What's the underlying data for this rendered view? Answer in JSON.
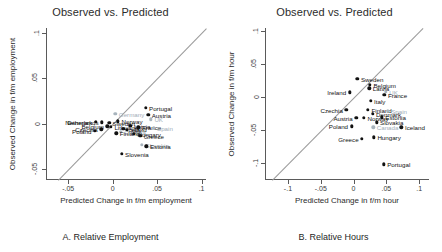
{
  "figure": {
    "panels": [
      {
        "id": "panel-a",
        "title": "Observed vs. Predicted",
        "caption": "A. Relative Employment",
        "xlabel": "Predicted Change in f/m employment",
        "ylabel": "Observed Change in f/m employment",
        "xticks": [
          "-.05",
          "0",
          ".05",
          ".1"
        ],
        "yticks": [
          "-.05",
          "0",
          ".05",
          ".1"
        ]
      },
      {
        "id": "panel-b",
        "title": "Observed vs. Predicted",
        "caption": "B. Relative Hours",
        "xlabel": "Predicted Change in f/m hour",
        "ylabel": "Observed Change in f/m hour",
        "xticks": [
          "-.1",
          "-.05",
          "0",
          ".05",
          ".1"
        ],
        "yticks": [
          "-.1",
          "-.05",
          "0",
          ".05",
          ".1"
        ]
      }
    ]
  },
  "chart_data": [
    {
      "type": "scatter",
      "panel": "A. Relative Employment",
      "title": "Observed vs. Predicted",
      "xlabel": "Predicted Change in f/m employment",
      "ylabel": "Observed Change in f/m employment",
      "xlim": [
        -0.075,
        0.105
      ],
      "ylim": [
        -0.062,
        0.105
      ],
      "xticks": [
        -0.05,
        0,
        0.05,
        0.1
      ],
      "yticks": [
        -0.05,
        0,
        0.05,
        0.1
      ],
      "grid": false,
      "legend": "none",
      "reference_line": {
        "type": "45-degree identity",
        "color": "#9a9a9a"
      },
      "points": [
        {
          "label": "Portugal",
          "x": 0.037,
          "y": 0.0175,
          "color": "dark"
        },
        {
          "label": "Austria",
          "x": 0.04,
          "y": 0.0095,
          "color": "dark"
        },
        {
          "label": "UK",
          "x": 0.043,
          "y": 0.0045,
          "color": "light"
        },
        {
          "label": "Germany",
          "x": 0.003,
          "y": 0.0105,
          "color": "light"
        },
        {
          "label": "Norway",
          "x": 0.006,
          "y": 0.0025,
          "color": "dark"
        },
        {
          "label": "Denmark",
          "x": -0.019,
          "y": 0.002,
          "color": "dark"
        },
        {
          "label": "Netherlands",
          "x": -0.012,
          "y": 0.0015,
          "color": "dark"
        },
        {
          "label": "Sweden",
          "x": -0.004,
          "y": 0.001,
          "color": "dark"
        },
        {
          "label": "Latvia",
          "x": 0.02,
          "y": -0.0025,
          "color": "dark"
        },
        {
          "label": "France",
          "x": 0.029,
          "y": -0.004,
          "color": "dark"
        },
        {
          "label": "Spain",
          "x": 0.046,
          "y": -0.0045,
          "color": "light"
        },
        {
          "label": "Belgium",
          "x": -0.006,
          "y": -0.003,
          "color": "dark"
        },
        {
          "label": "Lithuania",
          "x": -0.002,
          "y": -0.0035,
          "color": "dark"
        },
        {
          "label": "Czechia",
          "x": -0.013,
          "y": -0.0065,
          "color": "dark"
        },
        {
          "label": "Iceland",
          "x": 0.012,
          "y": -0.006,
          "color": "dark"
        },
        {
          "label": "Italy",
          "x": 0.016,
          "y": -0.007,
          "color": "dark"
        },
        {
          "label": "Canada",
          "x": 0.009,
          "y": -0.009,
          "color": "light"
        },
        {
          "label": "Poland",
          "x": -0.02,
          "y": -0.008,
          "color": "dark"
        },
        {
          "label": "Finland",
          "x": 0.004,
          "y": -0.0105,
          "color": "dark"
        },
        {
          "label": "Hungary",
          "x": 0.024,
          "y": -0.0115,
          "color": "dark"
        },
        {
          "label": "Greece",
          "x": 0.031,
          "y": -0.0135,
          "color": "dark"
        },
        {
          "label": "Slovakia",
          "x": 0.033,
          "y": -0.0235,
          "color": "light"
        },
        {
          "label": "Estonia",
          "x": 0.038,
          "y": -0.025,
          "color": "dark"
        },
        {
          "label": "Slovenia",
          "x": 0.01,
          "y": -0.033,
          "color": "dark"
        }
      ]
    },
    {
      "type": "scatter",
      "panel": "B. Relative Hours",
      "title": "Observed vs. Predicted",
      "xlabel": "Predicted Change in f/m hour",
      "ylabel": "Observed Change in f/m hour",
      "xlim": [
        -0.135,
        0.115
      ],
      "ylim": [
        -0.125,
        0.105
      ],
      "xticks": [
        -0.1,
        -0.05,
        0,
        0.05,
        0.1
      ],
      "yticks": [
        -0.1,
        -0.05,
        0,
        0.05,
        0.1
      ],
      "grid": false,
      "legend": "none",
      "reference_line": {
        "type": "45-degree identity",
        "color": "#9a9a9a"
      },
      "points": [
        {
          "label": "Sweden",
          "x": 0.006,
          "y": 0.0285,
          "color": "dark"
        },
        {
          "label": "Belgium",
          "x": 0.025,
          "y": 0.0195,
          "color": "dark"
        },
        {
          "label": "Latvia",
          "x": 0.024,
          "y": 0.014,
          "color": "dark"
        },
        {
          "label": "UK",
          "x": 0.049,
          "y": 0.0085,
          "color": "light"
        },
        {
          "label": "France",
          "x": 0.047,
          "y": 0.0035,
          "color": "dark"
        },
        {
          "label": "Ireland",
          "x": -0.006,
          "y": 0.0075,
          "color": "dark"
        },
        {
          "label": "Italy",
          "x": 0.026,
          "y": -0.0055,
          "color": "dark"
        },
        {
          "label": "Czechia",
          "x": -0.011,
          "y": -0.0185,
          "color": "dark"
        },
        {
          "label": "Finland",
          "x": 0.022,
          "y": -0.0185,
          "color": "dark"
        },
        {
          "label": "Spain",
          "x": 0.052,
          "y": -0.02,
          "color": "light"
        },
        {
          "label": "Denmark",
          "x": 0.029,
          "y": -0.0245,
          "color": "dark"
        },
        {
          "label": "Austria",
          "x": 0.004,
          "y": -0.0305,
          "color": "dark"
        },
        {
          "label": "Norway",
          "x": 0.016,
          "y": -0.031,
          "color": "dark"
        },
        {
          "label": "Estonia",
          "x": 0.043,
          "y": -0.03,
          "color": "dark"
        },
        {
          "label": "Slovakia",
          "x": 0.035,
          "y": -0.0375,
          "color": "dark"
        },
        {
          "label": "Poland",
          "x": -0.003,
          "y": -0.044,
          "color": "dark"
        },
        {
          "label": "Canada",
          "x": 0.03,
          "y": -0.0455,
          "color": "light"
        },
        {
          "label": "Iceland",
          "x": 0.073,
          "y": -0.045,
          "color": "dark"
        },
        {
          "label": "Greece",
          "x": 0.013,
          "y": -0.0625,
          "color": "dark"
        },
        {
          "label": "Hungary",
          "x": 0.031,
          "y": -0.0605,
          "color": "dark"
        },
        {
          "label": "Portugal",
          "x": 0.046,
          "y": -0.101,
          "color": "dark"
        }
      ]
    }
  ]
}
